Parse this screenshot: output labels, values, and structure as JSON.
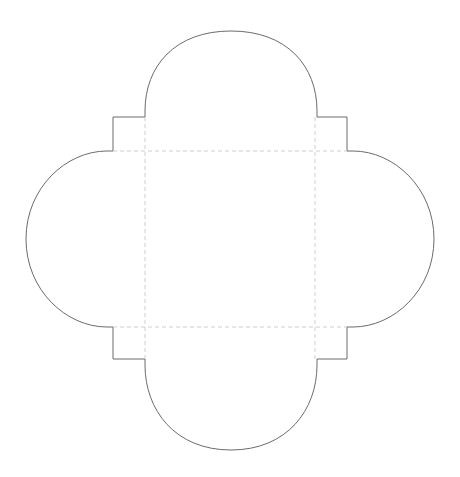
{
  "document": {
    "type": "papercraft-template",
    "title": "Envelope Cutting Template",
    "background_color": "#ffffff"
  },
  "canvas": {
    "width": 460,
    "height": 477
  },
  "style": {
    "cut_line_color": "#6b6b6b",
    "fold_line_color": "#cfcfcf",
    "cut_line_width": 1,
    "fold_line_width": 1,
    "fold_dash_pattern": "4 3"
  },
  "geometry": {
    "body_rect": {
      "left": 113,
      "top": 117,
      "right": 347,
      "bottom": 359
    },
    "fold_rect": {
      "left": 145,
      "top": 151,
      "right": 315,
      "bottom": 327
    },
    "top_flap": {
      "left": 145,
      "right": 317,
      "base_y": 117,
      "apex_y": 31
    },
    "bottom_flap": {
      "left": 145,
      "right": 317,
      "base_y": 359,
      "apex_y": 450
    },
    "left_flap": {
      "top_y": 151,
      "bottom_y": 327,
      "base_x": 113,
      "apex_x": 26
    },
    "right_flap": {
      "top_y": 151,
      "bottom_y": 327,
      "base_x": 347,
      "apex_x": 434
    },
    "notch_depth": 34
  },
  "paths": {
    "outline": "M 145 117 L 113 117 L 113 151 L 107 151 C 66 151 26 188 26 239 C 26 290 66 327 107 327 L 113 327 L 113 359 L 145 359 L 145 365 C 145 410 175 450 231 450 C 287 450 317 410 317 365 L 317 359 L 347 359 L 347 327 L 353 327 C 394 327 434 290 434 239 C 434 188 394 151 353 151 L 347 151 L 347 117 L 317 117 L 317 111 C 317 66 287 31 231 31 C 175 31 145 66 145 111 Z",
    "fold_vertical_left": "M 145 117 L 145 359",
    "fold_vertical_right": "M 315 117 L 315 359",
    "fold_horizontal_top": "M 113 151 L 347 151",
    "fold_horizontal_bottom": "M 113 327 L 347 327"
  },
  "labels": {
    "outline_name": "envelope-cut-outline",
    "top_flap_name": "top-flap",
    "bottom_flap_name": "bottom-flap",
    "left_flap_name": "left-side-flap",
    "right_flap_name": "right-side-flap",
    "body_name": "envelope-body-panel"
  }
}
